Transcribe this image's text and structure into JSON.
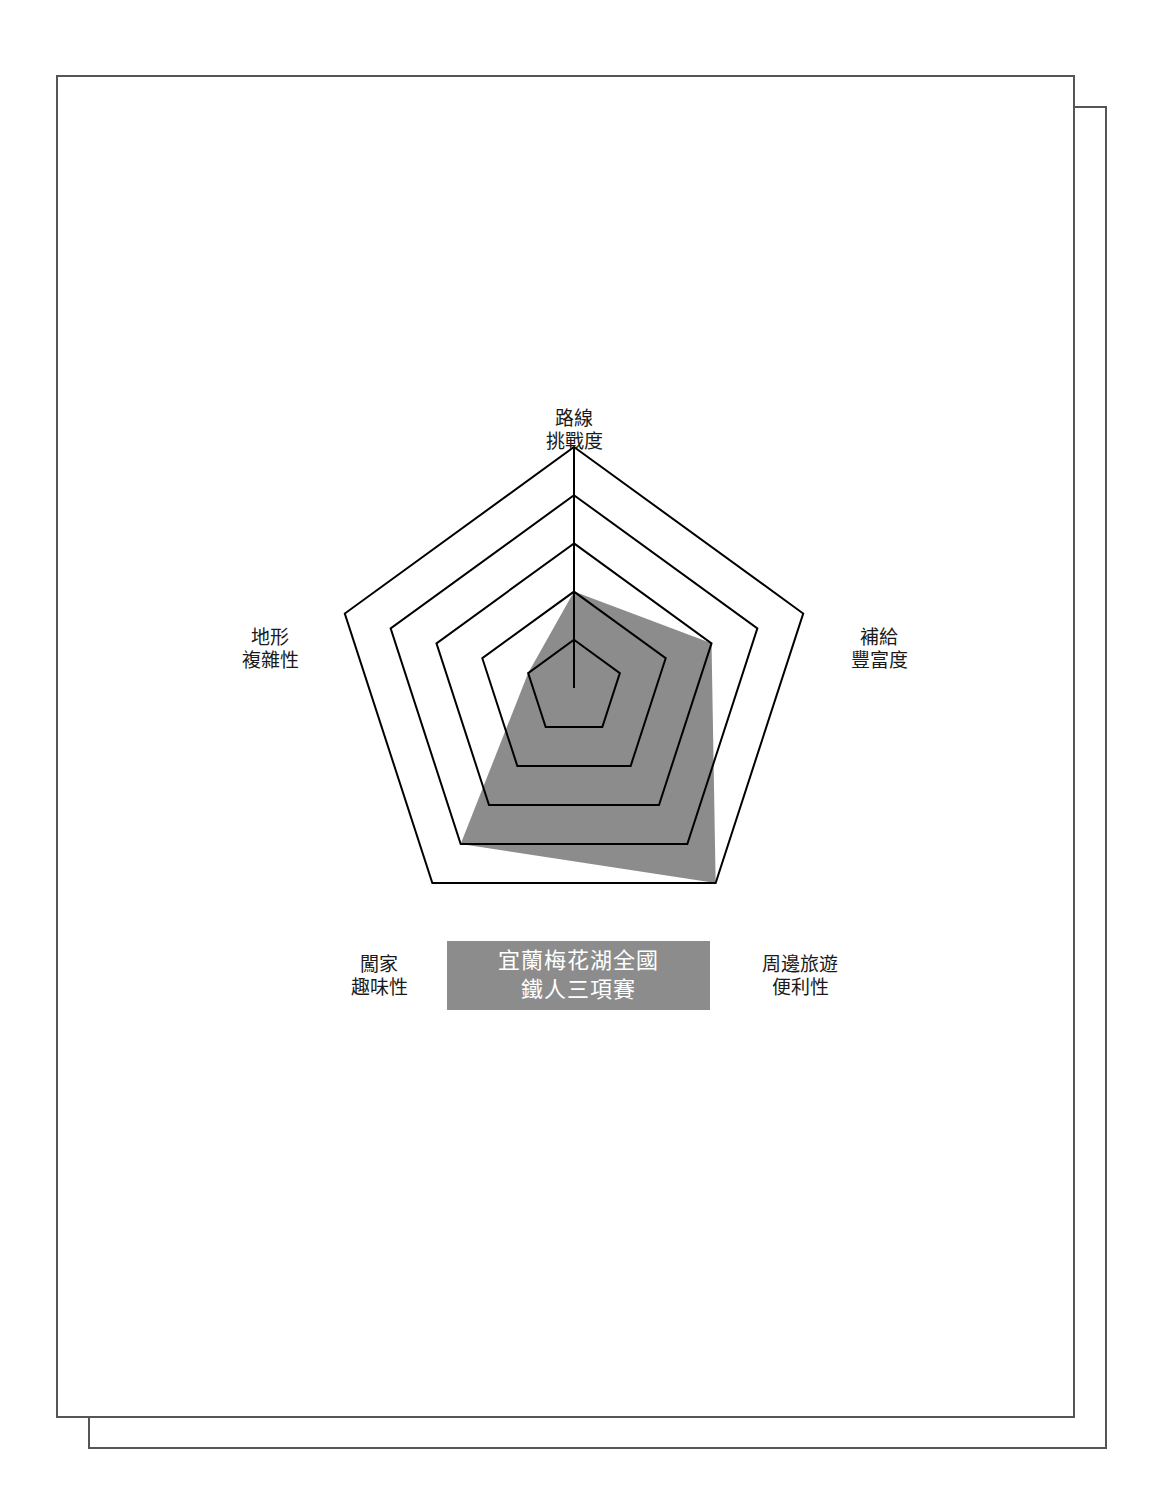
{
  "chart_data": {
    "type": "radar",
    "title_lines": [
      "宜蘭梅花湖全國",
      "鐵人三項賽"
    ],
    "axes": [
      "路線挑戰度",
      "補給豐富度",
      "周邊旅遊便利性",
      "闖家趣味性",
      "地形複雜性"
    ],
    "axis_labels": [
      {
        "line1": "路線",
        "line2": "挑戰度"
      },
      {
        "line1": "補給",
        "line2": "豐富度"
      },
      {
        "line1": "周邊旅遊",
        "line2": "便利性"
      },
      {
        "line1": "闖家",
        "line2": "趣味性"
      },
      {
        "line1": "地形",
        "line2": "複雜性"
      }
    ],
    "series": [
      {
        "name": "宜蘭梅花湖全國鐵人三項賽",
        "values": [
          2,
          3,
          5,
          4,
          1
        ]
      }
    ],
    "scale": {
      "min": 0,
      "max": 5,
      "rings": 5
    },
    "grid": true,
    "legend": "none",
    "colors": {
      "fill": "#8c8c8c",
      "grid": "#000000",
      "title_bg": "#8c8c8c",
      "title_text": "#ffffff"
    }
  }
}
